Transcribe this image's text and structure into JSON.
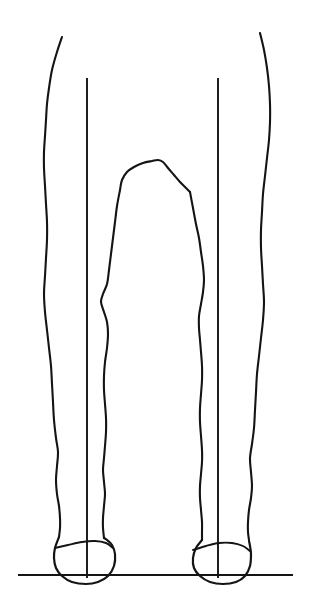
{
  "figure": {
    "view": "posterior",
    "background_color": "#ffffff",
    "ink_color": "#141414",
    "canvas": {
      "width": 311,
      "height": 611
    },
    "has_text_labels": false
  },
  "chart_data": {
    "type": "line",
    "xlabel": "",
    "ylabel": "",
    "xlim": [
      0,
      311
    ],
    "ylim": [
      0,
      611
    ],
    "grid": false,
    "legend": "none",
    "annotations": [],
    "series": [
      {
        "name": "left-outer-leg-contour",
        "stroke": "#141414",
        "points": [
          [
            62,
            37
          ],
          [
            57,
            52
          ],
          [
            52,
            70
          ],
          [
            49,
            88
          ],
          [
            47,
            104
          ],
          [
            46,
            120
          ],
          [
            45,
            136
          ],
          [
            44,
            152
          ],
          [
            44,
            168
          ],
          [
            45,
            186
          ],
          [
            46,
            204
          ],
          [
            47,
            222
          ],
          [
            47,
            240
          ],
          [
            46,
            258
          ],
          [
            45,
            276
          ],
          [
            44,
            294
          ],
          [
            45,
            312
          ],
          [
            47,
            330
          ],
          [
            49,
            348
          ],
          [
            51,
            366
          ],
          [
            52,
            384
          ],
          [
            53,
            402
          ],
          [
            54,
            420
          ],
          [
            56,
            438
          ],
          [
            58,
            452
          ],
          [
            57,
            466
          ],
          [
            56,
            480
          ],
          [
            57,
            494
          ],
          [
            59,
            506
          ],
          [
            60,
            518
          ],
          [
            60,
            528
          ],
          [
            59,
            537
          ]
        ]
      },
      {
        "name": "left-inner-leg-contour",
        "stroke": "#141414",
        "points": [
          [
            120,
            190
          ],
          [
            117,
            206
          ],
          [
            115,
            222
          ],
          [
            113,
            238
          ],
          [
            111,
            254
          ],
          [
            109,
            270
          ],
          [
            107,
            284
          ],
          [
            103,
            294
          ],
          [
            101,
            302
          ],
          [
            104,
            312
          ],
          [
            107,
            322
          ],
          [
            108,
            334
          ],
          [
            107,
            348
          ],
          [
            105,
            362
          ],
          [
            104,
            376
          ],
          [
            104,
            390
          ],
          [
            105,
            404
          ],
          [
            106,
            418
          ],
          [
            106,
            432
          ],
          [
            105,
            446
          ],
          [
            104,
            458
          ],
          [
            103,
            470
          ],
          [
            104,
            482
          ],
          [
            105,
            494
          ],
          [
            104,
            506
          ],
          [
            103,
            518
          ],
          [
            103,
            528
          ],
          [
            104,
            538
          ]
        ]
      },
      {
        "name": "right-inner-leg-contour",
        "stroke": "#141414",
        "points": [
          [
            190,
            192
          ],
          [
            193,
            208
          ],
          [
            196,
            224
          ],
          [
            199,
            238
          ],
          [
            201,
            252
          ],
          [
            203,
            266
          ],
          [
            204,
            280
          ],
          [
            203,
            292
          ],
          [
            201,
            304
          ],
          [
            199,
            316
          ],
          [
            199,
            328
          ],
          [
            200,
            340
          ],
          [
            201,
            352
          ],
          [
            202,
            366
          ],
          [
            202,
            380
          ],
          [
            201,
            394
          ],
          [
            200,
            408
          ],
          [
            200,
            422
          ],
          [
            201,
            436
          ],
          [
            202,
            450
          ],
          [
            202,
            462
          ],
          [
            201,
            474
          ],
          [
            200,
            486
          ],
          [
            200,
            498
          ],
          [
            201,
            510
          ],
          [
            202,
            522
          ],
          [
            202,
            532
          ],
          [
            202,
            540
          ]
        ]
      },
      {
        "name": "right-outer-leg-contour",
        "stroke": "#141414",
        "points": [
          [
            260,
            33
          ],
          [
            264,
            50
          ],
          [
            267,
            68
          ],
          [
            269,
            86
          ],
          [
            270,
            104
          ],
          [
            270,
            122
          ],
          [
            269,
            140
          ],
          [
            267,
            158
          ],
          [
            265,
            176
          ],
          [
            263,
            194
          ],
          [
            262,
            212
          ],
          [
            261,
            230
          ],
          [
            261,
            248
          ],
          [
            262,
            266
          ],
          [
            263,
            284
          ],
          [
            264,
            302
          ],
          [
            263,
            320
          ],
          [
            261,
            338
          ],
          [
            259,
            356
          ],
          [
            257,
            374
          ],
          [
            256,
            392
          ],
          [
            255,
            410
          ],
          [
            254,
            428
          ],
          [
            252,
            444
          ],
          [
            250,
            458
          ],
          [
            251,
            472
          ],
          [
            252,
            486
          ],
          [
            251,
            498
          ],
          [
            249,
            510
          ],
          [
            248,
            522
          ],
          [
            248,
            532
          ],
          [
            249,
            540
          ]
        ]
      },
      {
        "name": "left-plumb-line",
        "stroke": "#141414",
        "points": [
          [
            87,
            78
          ],
          [
            87,
            578
          ]
        ]
      },
      {
        "name": "right-plumb-line",
        "stroke": "#141414",
        "points": [
          [
            218,
            78
          ],
          [
            218,
            578
          ]
        ]
      },
      {
        "name": "ground-line",
        "stroke": "#141414",
        "points": [
          [
            18,
            575
          ],
          [
            293,
            575
          ]
        ]
      },
      {
        "name": "left-heel-outline",
        "stroke": "#141414",
        "points": [
          [
            59,
            537
          ],
          [
            55,
            548
          ],
          [
            54,
            558
          ],
          [
            56,
            568
          ],
          [
            62,
            576
          ],
          [
            72,
            582
          ],
          [
            86,
            584
          ],
          [
            98,
            582
          ],
          [
            108,
            576
          ],
          [
            114,
            566
          ],
          [
            115,
            554
          ],
          [
            112,
            545
          ],
          [
            107,
            540
          ],
          [
            104,
            538
          ]
        ]
      },
      {
        "name": "left-ankle-crease",
        "stroke": "#141414",
        "points": [
          [
            55,
            548
          ],
          [
            68,
            545
          ],
          [
            82,
            542
          ],
          [
            95,
            541
          ],
          [
            106,
            543
          ],
          [
            113,
            548
          ]
        ]
      },
      {
        "name": "right-heel-outline",
        "stroke": "#141414",
        "points": [
          [
            202,
            540
          ],
          [
            196,
            548
          ],
          [
            193,
            558
          ],
          [
            194,
            568
          ],
          [
            200,
            576
          ],
          [
            210,
            582
          ],
          [
            223,
            584
          ],
          [
            236,
            582
          ],
          [
            245,
            576
          ],
          [
            250,
            566
          ],
          [
            251,
            554
          ],
          [
            250,
            546
          ],
          [
            249,
            541
          ]
        ]
      },
      {
        "name": "right-ankle-crease",
        "stroke": "#141414",
        "points": [
          [
            193,
            550
          ],
          [
            206,
            546
          ],
          [
            219,
            543
          ],
          [
            232,
            543
          ],
          [
            243,
            546
          ],
          [
            250,
            551
          ]
        ]
      },
      {
        "name": "groin-apex-contour",
        "stroke": "#141414",
        "points": [
          [
            120,
            190
          ],
          [
            122,
            180
          ],
          [
            127,
            172
          ],
          [
            134,
            167
          ],
          [
            143,
            163
          ],
          [
            152,
            161
          ],
          [
            158,
            160
          ],
          [
            163,
            162
          ],
          [
            168,
            168
          ],
          [
            174,
            175
          ],
          [
            180,
            182
          ],
          [
            186,
            188
          ],
          [
            190,
            192
          ]
        ]
      }
    ]
  }
}
